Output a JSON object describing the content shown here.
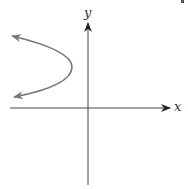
{
  "diagram": {
    "type": "coordinate-plane-sketch",
    "axes": {
      "x_label": "x",
      "y_label": "y",
      "origin_px": [
        88,
        108
      ],
      "color": "#333333"
    },
    "curve": {
      "shape": "parabola",
      "opens": "left",
      "vertex_px": [
        72,
        67
      ],
      "upper_end_px": [
        10,
        36
      ],
      "lower_end_px": [
        13,
        97
      ],
      "arrows_on_ends": true,
      "color": "#777777"
    }
  }
}
